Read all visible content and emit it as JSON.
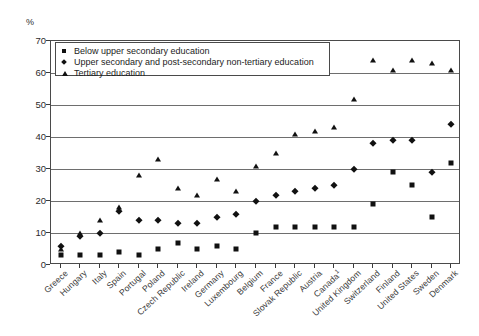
{
  "chart_data": {
    "type": "scatter",
    "title": "",
    "xlabel": "",
    "ylabel": "%",
    "ylim": [
      0,
      70
    ],
    "yticks": [
      0,
      10,
      20,
      30,
      40,
      50,
      60,
      70
    ],
    "grid": true,
    "legend_position": "top-left-inside",
    "categories": [
      "Greece",
      "Hungary",
      "Italy",
      "Spain",
      "Portugal",
      "Poland",
      "Czech Republic",
      "Ireland",
      "Germany",
      "Luxembourg",
      "Belgium",
      "France",
      "Slovak Republic",
      "Austria",
      "Canada",
      "United Kingdom",
      "Switzerland",
      "Finland",
      "United States",
      "Sweden",
      "Denmark"
    ],
    "category_notes": {
      "Canada": "1"
    },
    "series": [
      {
        "name": "Below upper secondary education",
        "marker": "square",
        "values": [
          3,
          3,
          3,
          4,
          3,
          5,
          7,
          5,
          6,
          5,
          10,
          12,
          12,
          12,
          12,
          12,
          19,
          29,
          25,
          15,
          32
        ]
      },
      {
        "name": "Upper secondary and post-secondary non-tertiary education",
        "marker": "diamond",
        "values": [
          6,
          9,
          10,
          17,
          14,
          14,
          13,
          13,
          15,
          16,
          20,
          22,
          23,
          24,
          25,
          30,
          38,
          39,
          39,
          29,
          44
        ]
      },
      {
        "name": "Tertiary education",
        "marker": "triangle",
        "values": [
          5,
          10,
          14,
          18,
          28,
          33,
          24,
          22,
          27,
          23,
          31,
          35,
          41,
          42,
          43,
          52,
          64,
          61,
          64,
          63,
          61
        ]
      }
    ]
  },
  "axis": {
    "unit_label": "%",
    "y_tick_labels": [
      "0",
      "10",
      "20",
      "30",
      "40",
      "50",
      "60",
      "70"
    ]
  },
  "legend": {
    "items": [
      {
        "label": "Below upper secondary education",
        "marker": "square-marker-icon"
      },
      {
        "label": "Upper secondary and post-secondary non-tertiary education",
        "marker": "diamond-marker-icon"
      },
      {
        "label": "Tertiary education",
        "marker": "triangle-marker-icon"
      }
    ]
  }
}
